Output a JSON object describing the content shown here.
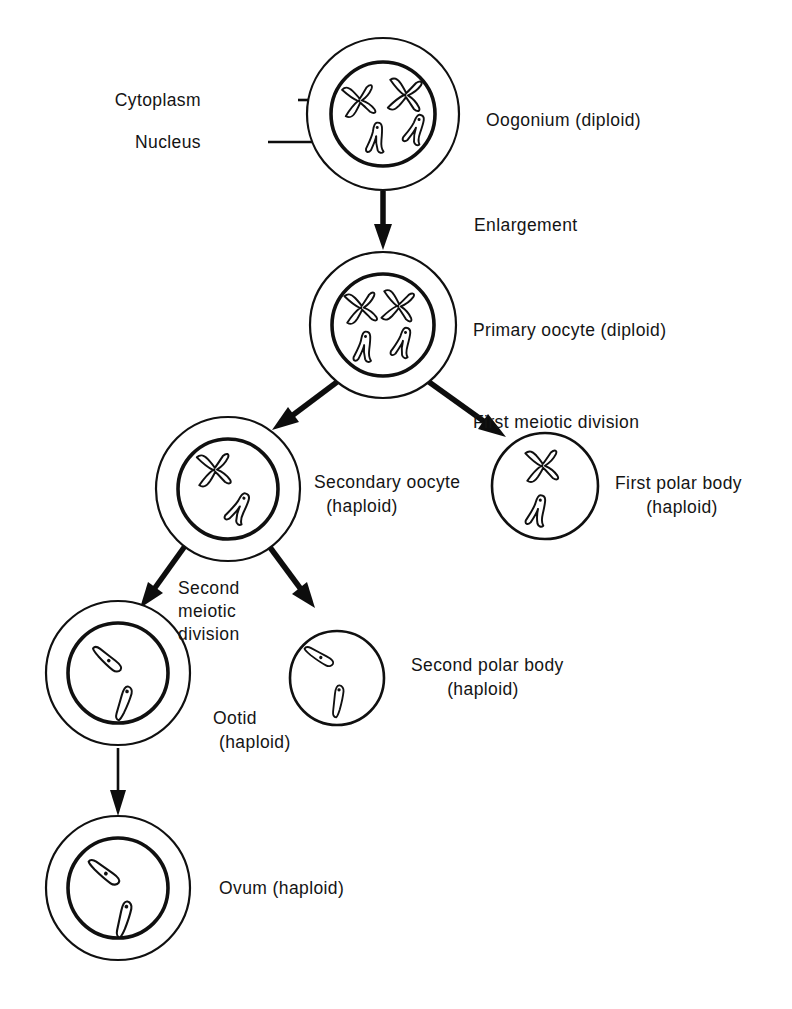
{
  "diagram": {
    "type": "biological-process-flowchart",
    "background_color": "#ffffff",
    "line_color": "#101010",
    "text_color": "#141414",
    "callouts": [
      {
        "id": "cytoplasm",
        "label": "Cytoplasm",
        "points_to": "oogonium-cytoplasm"
      },
      {
        "id": "nucleus",
        "label": "Nucleus",
        "points_to": "oogonium-nucleus"
      }
    ],
    "stages": [
      {
        "id": "oogonium",
        "label": "Oogonium (diploid)",
        "ploidy": "diploid",
        "chromosome_count": 4,
        "chromosome_types": [
          "x-shaped",
          "x-shaped",
          "v-shaped",
          "v-shaped"
        ],
        "has_nucleus_ring": true
      },
      {
        "id": "primary-oocyte",
        "label": "Primary oocyte (diploid)",
        "ploidy": "diploid",
        "chromosome_count": 4,
        "chromosome_types": [
          "x-shaped",
          "x-shaped",
          "v-shaped",
          "v-shaped"
        ],
        "has_nucleus_ring": true
      },
      {
        "id": "secondary-oocyte",
        "label": "Secondary oocyte\n(haploid)",
        "label_line1": "Secondary oocyte",
        "label_line2": "(haploid)",
        "ploidy": "haploid",
        "chromosome_count": 2,
        "chromosome_types": [
          "x-shaped",
          "v-shaped"
        ],
        "has_nucleus_ring": true
      },
      {
        "id": "first-polar-body",
        "label": "First polar body\n(haploid)",
        "label_line1": "First polar body",
        "label_line2": "(haploid)",
        "ploidy": "haploid",
        "chromosome_count": 2,
        "chromosome_types": [
          "x-shaped",
          "v-shaped"
        ],
        "has_nucleus_ring": false
      },
      {
        "id": "ootid",
        "label": "Ootid\n(haploid)",
        "label_line1": "Ootid",
        "label_line2": "(haploid)",
        "ploidy": "haploid",
        "chromosome_count": 2,
        "chromosome_types": [
          "rod-shaped",
          "rod-shaped"
        ],
        "has_nucleus_ring": true
      },
      {
        "id": "second-polar-body",
        "label": "Second polar body\n(haploid)",
        "label_line1": "Second polar body",
        "label_line2": "(haploid)",
        "ploidy": "haploid",
        "chromosome_count": 2,
        "chromosome_types": [
          "rod-shaped",
          "rod-shaped"
        ],
        "has_nucleus_ring": false
      },
      {
        "id": "ovum",
        "label": "Ovum (haploid)",
        "ploidy": "haploid",
        "chromosome_count": 2,
        "chromosome_types": [
          "rod-shaped",
          "rod-shaped"
        ],
        "has_nucleus_ring": true
      }
    ],
    "transitions": [
      {
        "id": "enlargement",
        "label": "Enlargement",
        "from": "oogonium",
        "to": "primary-oocyte"
      },
      {
        "id": "first-meiotic-division",
        "label": "First meiotic division",
        "from": "primary-oocyte",
        "to": "secondary-oocyte, first-polar-body"
      },
      {
        "id": "second-meiotic-division",
        "label": "Second\nmeiotic\ndivision",
        "label_line1": "Second",
        "label_line2": "meiotic",
        "label_line3": "division",
        "from": "secondary-oocyte",
        "to": "ootid, second-polar-body"
      },
      {
        "id": "maturation",
        "label": "",
        "from": "ootid",
        "to": "ovum"
      }
    ]
  }
}
